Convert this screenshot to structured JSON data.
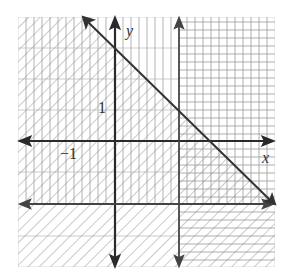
{
  "figure": {
    "axes": {
      "x_label": "x",
      "y_label": "y"
    },
    "tick_labels": {
      "y_tick": "1",
      "x_tick": "−1"
    },
    "boundaries": [
      {
        "name": "diagonal-line",
        "equation": "y = -x + 3",
        "style": "solid"
      },
      {
        "name": "vertical-line",
        "equation": "x = 2",
        "style": "solid"
      },
      {
        "name": "horizontal-line",
        "equation": "y = -2",
        "style": "solid"
      }
    ],
    "shading": {
      "diagonal_hatch": "below line y = -x + 3",
      "vertical_lines": "left of x = 2",
      "horizontal_lines": "above y = -2 / right of x = 2"
    },
    "colors": {
      "axis": "#333333",
      "grid": "#9a9a9a",
      "hatch": "#8a8a8a"
    }
  }
}
